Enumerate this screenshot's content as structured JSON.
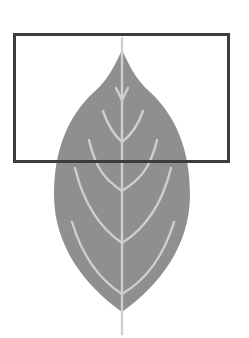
{
  "figure": {
    "highlight": "rectangle around leaf tip"
  },
  "colors": {
    "background": "#ffffff",
    "leaf_fill": "#8f8f8f",
    "vein": "#cfcfcf",
    "box_stroke": "#3d3d3d"
  },
  "shapes": {
    "highlight_box": {
      "x": 14,
      "y": 35,
      "width": 214,
      "height": 127,
      "stroke_width": 3
    },
    "leaf": {
      "tip_x": 122,
      "tip_y": 50,
      "bottom_y": 312,
      "left_x": 53,
      "right_x": 190
    },
    "stem": {
      "x": 122,
      "top_y": 35,
      "bottom_y": 334
    }
  }
}
